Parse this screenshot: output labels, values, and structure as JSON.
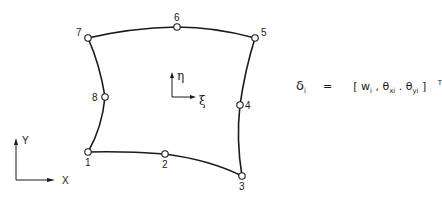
{
  "diagram": {
    "type": "8-node serendipity plate element",
    "nodes": [
      {
        "id": "1",
        "x": 88,
        "y": 152,
        "label_dx": -3,
        "label_dy": 14
      },
      {
        "id": "2",
        "x": 165,
        "y": 154,
        "label_dx": -3,
        "label_dy": 14
      },
      {
        "id": "3",
        "x": 242,
        "y": 176,
        "label_dx": -3,
        "label_dy": 14
      },
      {
        "id": "4",
        "x": 240,
        "y": 105,
        "label_dx": 5,
        "label_dy": 4
      },
      {
        "id": "5",
        "x": 255,
        "y": 38,
        "label_dx": 6,
        "label_dy": -2
      },
      {
        "id": "6",
        "x": 177,
        "y": 27,
        "label_dx": -3,
        "label_dy": -6
      },
      {
        "id": "7",
        "x": 88,
        "y": 38,
        "label_dx": -12,
        "label_dy": -2
      },
      {
        "id": "8",
        "x": 105,
        "y": 97,
        "label_dx": -13,
        "label_dy": 4
      }
    ],
    "local_axes": {
      "eta_label": "η",
      "xi_label": "ξ"
    },
    "global_axes": {
      "x_label": "X",
      "y_label": "Y"
    },
    "formula": {
      "lhs": "δ",
      "lhs_sub": "i",
      "equals": "=",
      "open": "[",
      "w": "w",
      "w_sub": "i",
      "sep1": ",",
      "theta_x": "θ",
      "theta_x_sub": "xi",
      "sep2": ".",
      "theta_y": "θ",
      "theta_y_sub": "yi",
      "close": "]",
      "sup": "T"
    }
  }
}
